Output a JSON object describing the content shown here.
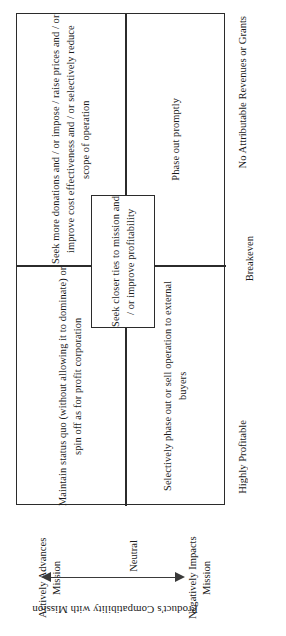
{
  "diagram": {
    "orientation": "rotated-90-ccw",
    "frame_color": "#2b2b2b",
    "background": "#ffffff"
  },
  "quadrants": {
    "top_left": "Seek more donations and / or impose / raise prices and / or improve cost effectiveness and / or selectively reduce scope of operation",
    "top_right": "Phase out promptly",
    "bottom_left": "Maintain status quo (without allowing it to dominate) or spin off as for profit corporation",
    "bottom_right": "Selectively phase out or sell operation to external buyers"
  },
  "center_box": {
    "text": "Seek closer ties to mission and / or improve profitability"
  },
  "profitability_axis": {
    "name": "Profitability",
    "labels": [
      "No Attributable Revenues or Grants",
      "Breakeven",
      "Highly Profitable"
    ]
  },
  "mission_axis": {
    "title": "Product's Compatibility with Mission",
    "left_label": "Actively Advances Mission",
    "center_label": "Neutral",
    "right_label": "Negatively Impacts Mission",
    "arrow": "double-headed"
  },
  "chart_data": {
    "type": "table",
    "title": "Product's Compatibility with Mission",
    "xlabel": "Product's Compatibility with Mission",
    "ylabel": "Profitability",
    "x_categories": [
      "Actively Advances Mission",
      "Neutral",
      "Negatively Impacts Mission"
    ],
    "y_categories": [
      "No Attributable Revenues or Grants",
      "Breakeven",
      "Highly Profitable"
    ],
    "grid": true,
    "legend": "none",
    "cells": [
      {
        "row": "No Attributable Revenues or Grants",
        "col": "Actively Advances Mission",
        "text": "Seek more donations and / or impose / raise prices and / or improve cost effectiveness and / or selectively reduce scope of operation"
      },
      {
        "row": "No Attributable Revenues or Grants",
        "col": "Negatively Impacts Mission",
        "text": "Phase out promptly"
      },
      {
        "row": "Highly Profitable",
        "col": "Actively Advances Mission",
        "text": "Maintain status quo (without allowing it to dominate) or spin off as for profit corporation"
      },
      {
        "row": "Highly Profitable",
        "col": "Negatively Impacts Mission",
        "text": "Selectively phase out or sell operation to external buyers"
      },
      {
        "row": "Breakeven",
        "col": "Neutral",
        "text": "Seek closer ties to mission and / or improve profitability"
      }
    ]
  }
}
